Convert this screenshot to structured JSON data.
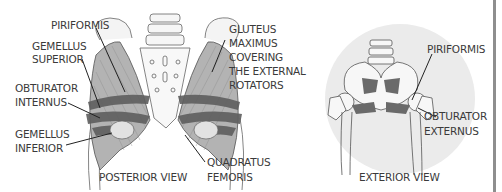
{
  "diagram": {
    "posterior": {
      "caption": "POSTERIOR VIEW",
      "labels": {
        "piriformis": "PIRIFORMIS",
        "gemellus_superior_1": "GEMELLUS",
        "gemellus_superior_2": "SUPERIOR",
        "obturator_internus_1": "OBTURATOR",
        "obturator_internus_2": "INTERNUS",
        "gemellus_inferior_1": "GEMELLUS",
        "gemellus_inferior_2": "INFERIOR",
        "gluteus_1": "GLUTEUS",
        "gluteus_2": "MAXIMUS",
        "gluteus_3": "COVERING",
        "gluteus_4": "THE EXTERNAL",
        "gluteus_5": "ROTATORS",
        "quadratus_1": "QUADRATUS",
        "quadratus_2": "FEMORIS"
      }
    },
    "exterior": {
      "caption": "EXTERIOR VIEW",
      "labels": {
        "piriformis": "PIRIFORMIS",
        "obturator_externus_1": "OBTURATOR",
        "obturator_externus_2": "EXTERNUS"
      }
    },
    "colors": {
      "muscle_light": "#a8a8a8",
      "muscle_dark": "#5a5a5a",
      "bone": "#f2f2f2",
      "outline": "#555555",
      "circle_bg": "#ebebeb",
      "text": "#3a3a3a"
    }
  }
}
